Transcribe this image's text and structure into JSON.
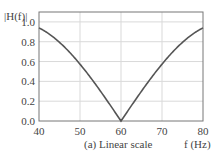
{
  "chart_data": {
    "type": "line",
    "title": "",
    "caption": "(a) Linear scale",
    "xlabel": "f (Hz)",
    "ylabel": "|H(f)|",
    "xlim": [
      40,
      80
    ],
    "ylim": [
      0.0,
      1.1
    ],
    "x_ticks": [
      40,
      50,
      60,
      70,
      80
    ],
    "y_ticks": [
      "0.0",
      "0.2",
      "0.4",
      "0.6",
      "0.8",
      "1.0"
    ],
    "grid": true,
    "series": [
      {
        "name": "|H(f)|",
        "x": [
          40,
          42,
          44,
          46,
          48,
          50,
          52,
          54,
          56,
          58,
          60,
          62,
          64,
          66,
          68,
          70,
          72,
          74,
          76,
          78,
          80
        ],
        "values": [
          0.94,
          0.93,
          0.89,
          0.83,
          0.74,
          0.57,
          0.46,
          0.36,
          0.24,
          0.12,
          0.0,
          0.12,
          0.24,
          0.36,
          0.46,
          0.57,
          0.74,
          0.83,
          0.89,
          0.93,
          0.94
        ]
      }
    ],
    "line_color": "#555555",
    "grid_color": "#d9d9d9"
  }
}
